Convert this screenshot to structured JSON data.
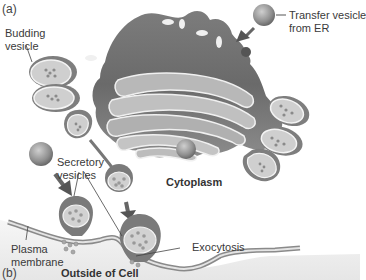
{
  "figure": {
    "panels": [
      {
        "id": "a",
        "label": "(a)"
      },
      {
        "id": "b",
        "label": "(b)"
      }
    ],
    "labels": {
      "budding_vesicle_line1": "Budding",
      "budding_vesicle_line2": "vesicle",
      "transfer_vesicle_line1": "Transfer vesicle",
      "transfer_vesicle_line2": "from ER",
      "secretory_vesicles_line1": "Secretory",
      "secretory_vesicles_line2": "vesicles",
      "cytoplasm": "Cytoplasm",
      "plasma_membrane_line1": "Plasma",
      "plasma_membrane_line2": "membrane",
      "exocytosis": "Exocytosis",
      "outside_of_cell": "Outside of Cell"
    },
    "colors": {
      "golgi_dark": "#6e6e6e",
      "golgi_mid": "#8a8a8a",
      "cisterna_light": "#b8b8b8",
      "membrane_edge": "#f2f2f2",
      "vesicle_fill": "#c4c4c4",
      "vesicle_dark": "#7a7a7a",
      "outside_bg": "#ededed",
      "text": "#3a3a3a"
    }
  }
}
